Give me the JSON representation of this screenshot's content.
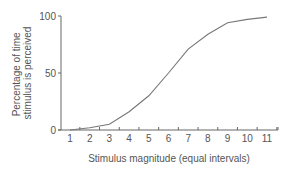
{
  "chart_data": {
    "type": "line",
    "title": "",
    "xlabel": "Stimulus magnitude (equal intervals)",
    "ylabel_lines": [
      "Percentage of time",
      "stimulus is perceived"
    ],
    "ylabel": "Percentage of time stimulus is perceived",
    "x": [
      1,
      2,
      3,
      4,
      5,
      6,
      7,
      8,
      9,
      10,
      11
    ],
    "categories": [
      "1",
      "2",
      "3",
      "4",
      "5",
      "6",
      "7",
      "8",
      "9",
      "10",
      "11"
    ],
    "series": [
      {
        "name": "Psychometric function",
        "values": [
          0,
          2,
          5,
          16,
          30,
          50,
          71,
          84,
          94,
          97,
          99
        ]
      }
    ],
    "yticks": [
      "0",
      "50",
      "100"
    ],
    "ytick_values": [
      0,
      50,
      100
    ],
    "ylim": [
      0,
      100
    ],
    "xlim": [
      0.5,
      11.5
    ],
    "grid": false,
    "legend": "none",
    "colors": {
      "line": "#777777",
      "axis": "#666666",
      "text": "#555555"
    }
  }
}
